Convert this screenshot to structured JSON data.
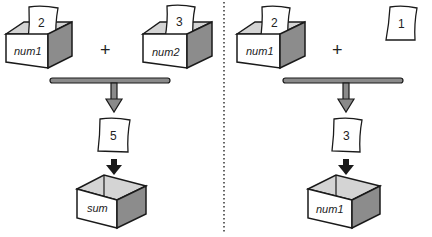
{
  "colors": {
    "stroke": "#1a1a1a",
    "box_front": "#ffffff",
    "box_inner": "#d4d4d4",
    "box_side": "#8c8c8c",
    "bar_fill": "#8a8a8a",
    "arrow_dark": "#1a1a1a",
    "divider": "#333333"
  },
  "left_panel": {
    "box_a": {
      "label": "num1",
      "card_value": "2"
    },
    "operator": "+",
    "box_b": {
      "label": "num2",
      "card_value": "3"
    },
    "result_card": "5",
    "target_box": {
      "label": "sum"
    }
  },
  "right_panel": {
    "box_a": {
      "label": "num1",
      "card_value": "2"
    },
    "operator": "+",
    "literal_card": "1",
    "result_card": "3",
    "target_box": {
      "label": "num1"
    }
  }
}
